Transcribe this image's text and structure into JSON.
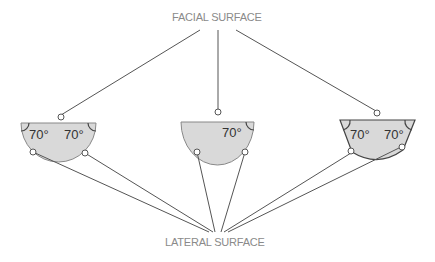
{
  "labels": {
    "top": "FACIAL SURFACE",
    "bottom": "LATERAL SURFACE"
  },
  "teeth": [
    {
      "name": "left",
      "angles": [
        "70°",
        "70°"
      ]
    },
    {
      "name": "middle",
      "angles": [
        "70°"
      ]
    },
    {
      "name": "right",
      "angles": [
        "70°",
        "70°"
      ]
    }
  ],
  "colors": {
    "fill": "#d9d9d9",
    "stroke": "#555555",
    "line": "#555555",
    "label": "#8a8a8a"
  }
}
